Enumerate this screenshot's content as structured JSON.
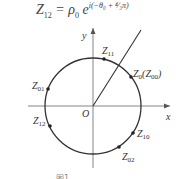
{
  "formula": {
    "lhs": "Z",
    "lhs_sub": "12",
    "eq": " = ρ",
    "rho_sub": "0",
    "e": " e",
    "exponent": "i(−θ₀ + ⁴⁄₃π)"
  },
  "axes": {
    "x_label": "x",
    "y_label": "y",
    "origin_label": "O"
  },
  "points": [
    {
      "name": "Z",
      "sub": "11"
    },
    {
      "name": "Z",
      "sub": "0",
      "extra": "(Z",
      "extra_sub": "00",
      "close": ")"
    },
    {
      "name": "Z",
      "sub": "01"
    },
    {
      "name": "Z",
      "sub": "12"
    },
    {
      "name": "Z",
      "sub": "10"
    },
    {
      "name": "Z",
      "sub": "02"
    }
  ],
  "caption": "图1  ……"
}
